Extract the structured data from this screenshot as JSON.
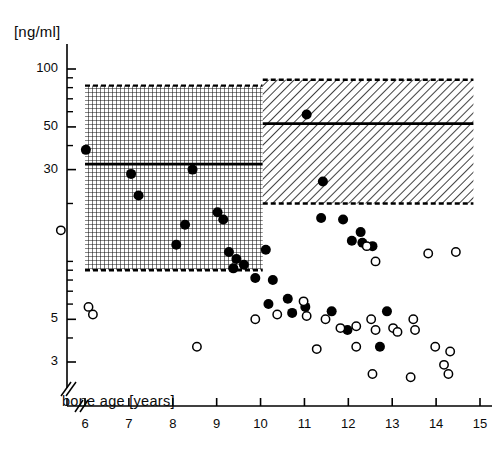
{
  "chart_data": {
    "type": "scatter",
    "title": "",
    "xlabel": "bone age  [years]",
    "ylabel": "[ng/ml]",
    "yscale": "log",
    "xlim": [
      5.3,
      15.3
    ],
    "ylim": [
      2.2,
      140
    ],
    "grid": false,
    "legend_position": "none",
    "x_ticks": [
      6,
      7,
      8,
      9,
      10,
      11,
      12,
      13,
      14,
      15
    ],
    "x_tick_labels": [
      "6",
      "7",
      "8",
      "9",
      "10",
      "11",
      "12",
      "13",
      "14",
      "15"
    ],
    "y_ticks": [
      100,
      50,
      30,
      3,
      5
    ],
    "y_tick_labels": [
      "100",
      "50",
      "30",
      "3",
      "5"
    ],
    "y_minor_ticks": [
      90,
      80,
      70,
      60,
      40,
      20,
      10,
      9,
      8,
      7,
      6,
      4
    ],
    "axis_break_x": true,
    "axis_break_y": true,
    "reference_bands": [
      {
        "name": "prepubertal-reference-band",
        "pattern": "cross-hatch",
        "x_range": [
          6.0,
          10.05
        ],
        "y_range": [
          9.0,
          82.0
        ],
        "mean_line_y": 32.0,
        "border": "dashed"
      },
      {
        "name": "pubertal-reference-band",
        "pattern": "diagonal-hatch",
        "x_range": [
          10.05,
          14.85
        ],
        "y_range": [
          20.0,
          88.0
        ],
        "mean_line_y": 52.0,
        "border": "dashed"
      }
    ],
    "series": [
      {
        "name": "filled",
        "marker": "filled-circle",
        "color": "#000000",
        "points": [
          [
            6.02,
            38.0
          ],
          [
            7.05,
            28.5
          ],
          [
            7.22,
            22.0
          ],
          [
            8.45,
            30.0
          ],
          [
            8.28,
            15.5
          ],
          [
            8.08,
            12.2
          ],
          [
            9.02,
            18.0
          ],
          [
            9.15,
            16.5
          ],
          [
            9.28,
            11.2
          ],
          [
            9.45,
            10.3
          ],
          [
            9.38,
            9.2
          ],
          [
            9.62,
            9.6
          ],
          [
            9.88,
            8.2
          ],
          [
            10.12,
            11.5
          ],
          [
            10.28,
            8.0
          ],
          [
            10.18,
            6.0
          ],
          [
            10.62,
            6.4
          ],
          [
            11.05,
            58.0
          ],
          [
            11.42,
            26.0
          ],
          [
            11.38,
            16.8
          ],
          [
            11.88,
            16.5
          ],
          [
            12.28,
            14.2
          ],
          [
            12.32,
            12.5
          ],
          [
            12.08,
            12.8
          ],
          [
            12.55,
            12.0
          ],
          [
            11.02,
            5.8
          ],
          [
            10.72,
            5.4
          ],
          [
            11.62,
            5.5
          ],
          [
            12.88,
            5.5
          ],
          [
            11.98,
            4.4
          ],
          [
            12.72,
            3.6
          ]
        ]
      },
      {
        "name": "open",
        "marker": "open-circle",
        "color": "#000000",
        "points": [
          [
            5.45,
            14.5
          ],
          [
            6.08,
            5.8
          ],
          [
            6.18,
            5.3
          ],
          [
            9.88,
            5.0
          ],
          [
            10.38,
            5.3
          ],
          [
            10.98,
            6.2
          ],
          [
            11.05,
            5.2
          ],
          [
            11.48,
            5.0
          ],
          [
            11.82,
            4.5
          ],
          [
            12.18,
            4.6
          ],
          [
            12.52,
            5.0
          ],
          [
            12.62,
            4.4
          ],
          [
            13.02,
            4.5
          ],
          [
            13.12,
            4.3
          ],
          [
            13.48,
            5.0
          ],
          [
            13.52,
            4.4
          ],
          [
            12.42,
            12.0
          ],
          [
            12.62,
            10.0
          ],
          [
            13.82,
            11.0
          ],
          [
            8.55,
            3.6
          ],
          [
            11.28,
            3.5
          ],
          [
            12.18,
            3.6
          ],
          [
            13.98,
            3.6
          ],
          [
            12.55,
            2.6
          ],
          [
            13.42,
            2.5
          ],
          [
            14.28,
            2.6
          ],
          [
            14.32,
            3.4
          ],
          [
            14.45,
            11.2
          ],
          [
            14.18,
            2.9
          ]
        ]
      }
    ]
  },
  "axes": {
    "y_unit_label": "[ng/ml]",
    "x_axis_title": "bone age  [years]"
  },
  "colors": {
    "ink": "#000000",
    "background": "#ffffff",
    "hatch": "#1a1a1a"
  }
}
